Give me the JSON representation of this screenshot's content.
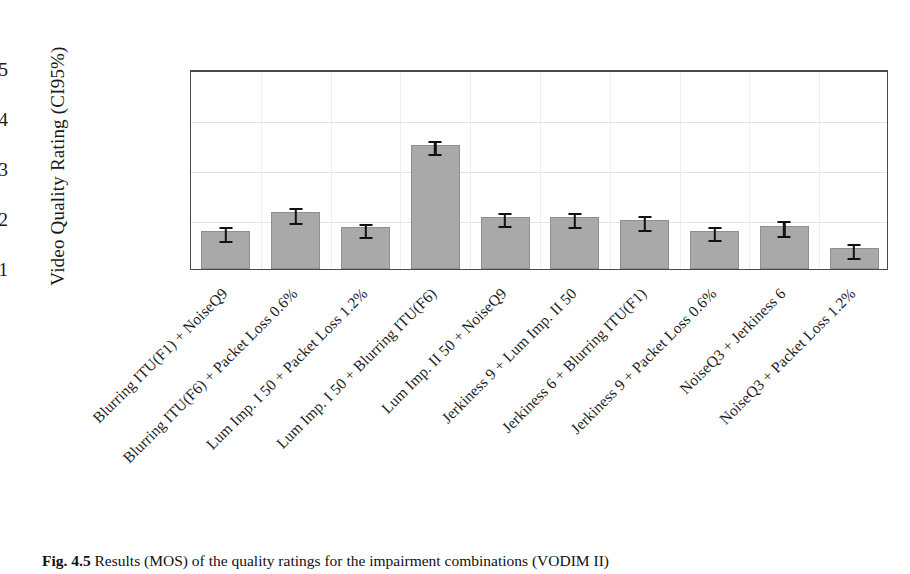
{
  "chart_data": {
    "type": "bar",
    "title": "",
    "xlabel": "",
    "ylabel": "Video Quality Rating (CI95%)",
    "ylim": [
      1,
      5
    ],
    "yticks": [
      "1",
      "2",
      "3",
      "4",
      "5"
    ],
    "grid": true,
    "legend": "none",
    "categories": [
      "Blurring ITU(F1) + NoiseQ9",
      "Blurring ITU(F6) + Packet Loss 0.6%",
      "Lum Imp. I 50 + Packet Loss 1.2%",
      "Lum Imp. I 50 + Blurring ITU(F6)",
      "Lum Imp. II 50 + NoiseQ9",
      "Jerkiness 9 + Lum Imp. II 50",
      "Jerkiness 6 + Blurring ITU(F1)",
      "Jerkiness 9 + Packet Loss 0.6%",
      "NoiseQ3 + Jerkiness 6",
      "NoiseQ3 + Packet Loss 1.2%"
    ],
    "values": [
      1.76,
      2.14,
      1.84,
      3.49,
      2.05,
      2.05,
      1.98,
      1.77,
      1.87,
      1.42
    ],
    "errors": [
      0.14,
      0.15,
      0.13,
      0.13,
      0.13,
      0.14,
      0.14,
      0.13,
      0.15,
      0.14
    ],
    "series": [
      {
        "name": "MOS",
        "values": [
          1.76,
          2.14,
          1.84,
          3.49,
          2.05,
          2.05,
          1.98,
          1.77,
          1.87,
          1.42
        ]
      }
    ],
    "bar_color": "#a9a9a9",
    "error_color": "#111111"
  },
  "caption": {
    "figure_number": "Fig. 4.5",
    "text": "Results (MOS) of the quality ratings for the impairment combinations (VODIM II)"
  }
}
